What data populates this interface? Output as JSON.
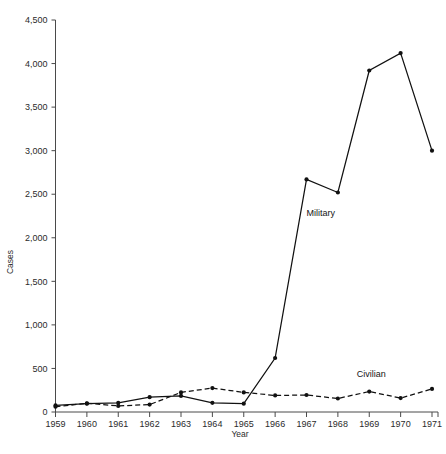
{
  "chart_data": {
    "type": "line",
    "title": "",
    "xlabel": "Year",
    "ylabel": "Cases",
    "categories": [
      "1959",
      "1960",
      "1961",
      "1962",
      "1963",
      "1964",
      "1965",
      "1966",
      "1967",
      "1968",
      "1969",
      "1970",
      "1971"
    ],
    "x": [
      1959,
      1960,
      1961,
      1962,
      1963,
      1964,
      1965,
      1966,
      1967,
      1968,
      1969,
      1970,
      1971
    ],
    "xlim": [
      1959,
      1971
    ],
    "ylim": [
      0,
      4500
    ],
    "ytick_labels": [
      "0",
      "500",
      "1,000",
      "1,500",
      "2,000",
      "2,500",
      "3,000",
      "3,500",
      "4,000",
      "4,500"
    ],
    "ytick_values": [
      0,
      500,
      1000,
      1500,
      2000,
      2500,
      3000,
      3500,
      4000,
      4500
    ],
    "xtick_labels": [
      "1959",
      "1960",
      "1961",
      "1962",
      "1963",
      "1964",
      "1965",
      "1966",
      "1967",
      "1968",
      "1969",
      "1970",
      "1971"
    ],
    "grid": false,
    "legend_position": "inline-annotation",
    "series": [
      {
        "name": "Military",
        "line_style": "solid",
        "marker": "filled-circle",
        "label_x": 1967,
        "label_y": 2250,
        "values": [
          75,
          95,
          105,
          170,
          185,
          105,
          95,
          620,
          2670,
          2520,
          3920,
          4120,
          3000
        ]
      },
      {
        "name": "Civilian",
        "line_style": "dashed",
        "marker": "filled-circle",
        "label_x": 1968.6,
        "label_y": 400,
        "values": [
          60,
          100,
          70,
          85,
          225,
          275,
          225,
          190,
          195,
          155,
          235,
          160,
          265
        ]
      }
    ],
    "annotations": [
      {
        "text": "Military",
        "x": 1967,
        "y": 2250
      },
      {
        "text": "Civilian",
        "x": 1968.6,
        "y": 400
      }
    ]
  },
  "colors": {
    "background": "#ffffff",
    "axis": "#4a4a4a",
    "text": "#2b2b2b",
    "series_line": "#111111"
  }
}
